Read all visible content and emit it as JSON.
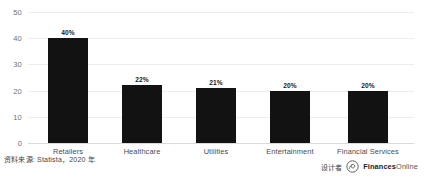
{
  "chart_data": {
    "type": "bar",
    "title": "",
    "subtitle": "",
    "xlabel": "",
    "ylabel": "",
    "ylim": [
      0,
      50
    ],
    "yticks": [
      0,
      10,
      20,
      30,
      40,
      50
    ],
    "grid": true,
    "legend": false,
    "categories": [
      "Retailers",
      "Healthcare",
      "Utilities",
      "Entertainment",
      "Financial Services"
    ],
    "values": [
      40,
      22,
      21,
      20,
      20
    ],
    "data_labels": [
      "40%",
      "22%",
      "21%",
      "20%",
      "20%"
    ],
    "bar_color": "#121212",
    "gridline_color": "#eceded",
    "background_color": "#ffffff"
  },
  "footer": {
    "source_note": "资料来源: Statista，2020 年",
    "credit_label": "设计者",
    "brand_primary": "Finances",
    "brand_secondary": "Online"
  }
}
